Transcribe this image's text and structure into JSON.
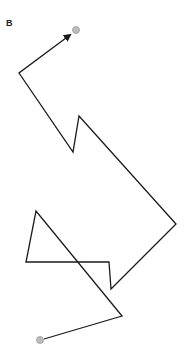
{
  "panel": {
    "label": "B"
  },
  "path": {
    "stroke_color": "#1a1a1a",
    "stroke_width": 1.3,
    "points": [
      [
        44,
        339
      ],
      [
        122,
        316
      ],
      [
        36,
        211
      ],
      [
        26,
        262
      ],
      [
        109,
        262
      ],
      [
        111,
        289
      ],
      [
        176,
        224
      ],
      [
        79,
        116
      ],
      [
        73,
        152
      ],
      [
        19,
        73
      ],
      [
        70,
        35
      ]
    ],
    "end_arrow": true
  },
  "markers": {
    "color": "#bdbdbd",
    "border": "#9a9a9a",
    "start": {
      "x": 40,
      "y": 340,
      "r": 3.5
    },
    "end": {
      "x": 76,
      "y": 30,
      "r": 3.5
    }
  }
}
